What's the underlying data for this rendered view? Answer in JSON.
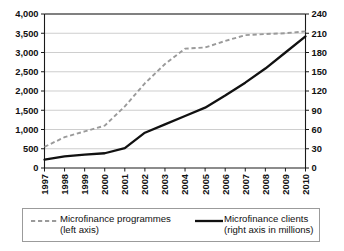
{
  "chart_data": {
    "type": "line",
    "title": "",
    "xlabel": "",
    "grid": true,
    "legend_position": "bottom",
    "categories": [
      "1997",
      "1998",
      "1999",
      "2000",
      "2001",
      "2002",
      "2003",
      "2004",
      "2005",
      "2006",
      "2007",
      "2008",
      "2009",
      "2010"
    ],
    "axes": {
      "left": {
        "label": "Microfinance programmes",
        "ylim": [
          0,
          4000
        ],
        "tick_step": 500,
        "ticks": [
          "0",
          "500",
          "1,000",
          "1,500",
          "2,000",
          "2,500",
          "3,000",
          "3,500",
          "4,000"
        ]
      },
      "right": {
        "label": "Microfinance clients (millions)",
        "ylim": [
          0,
          240
        ],
        "tick_step": 30,
        "ticks": [
          "0",
          "30",
          "60",
          "90",
          "120",
          "150",
          "180",
          "210",
          "240"
        ]
      }
    },
    "series": [
      {
        "name": "Microfinance programmes",
        "axis": "left",
        "style": "dashed",
        "color": "#9a9a9a",
        "values": [
          550,
          800,
          950,
          1100,
          1600,
          2200,
          2700,
          3100,
          3130,
          3300,
          3450,
          3480,
          3500,
          3550
        ]
      },
      {
        "name": "Microfinance clients",
        "axis": "right",
        "style": "solid",
        "color": "#111111",
        "values": [
          13,
          18,
          21,
          23,
          31,
          55,
          68,
          81,
          94,
          113,
          133,
          155,
          180,
          205
        ]
      }
    ]
  },
  "legend": {
    "entries": [
      {
        "swatch": "dashed-line-swatch",
        "line1": "Microfinance programmes",
        "line2": "(left axis)"
      },
      {
        "swatch": "solid-line-swatch",
        "line1": "Microfinance clients",
        "line2": "(right axis in millions)"
      }
    ]
  }
}
